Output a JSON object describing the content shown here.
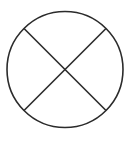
{
  "diagram": {
    "shape": "circle-with-x",
    "background": "#ffffff",
    "stroke_color": "#2b2b2b",
    "stroke_width": 1.6,
    "circle": {
      "cx": 65,
      "cy": 69.5,
      "r": 58
    },
    "lines": [
      {
        "x1": 24,
        "y1": 28.5,
        "x2": 106,
        "y2": 110.5
      },
      {
        "x1": 106,
        "y1": 28.5,
        "x2": 24,
        "y2": 110.5
      }
    ]
  }
}
